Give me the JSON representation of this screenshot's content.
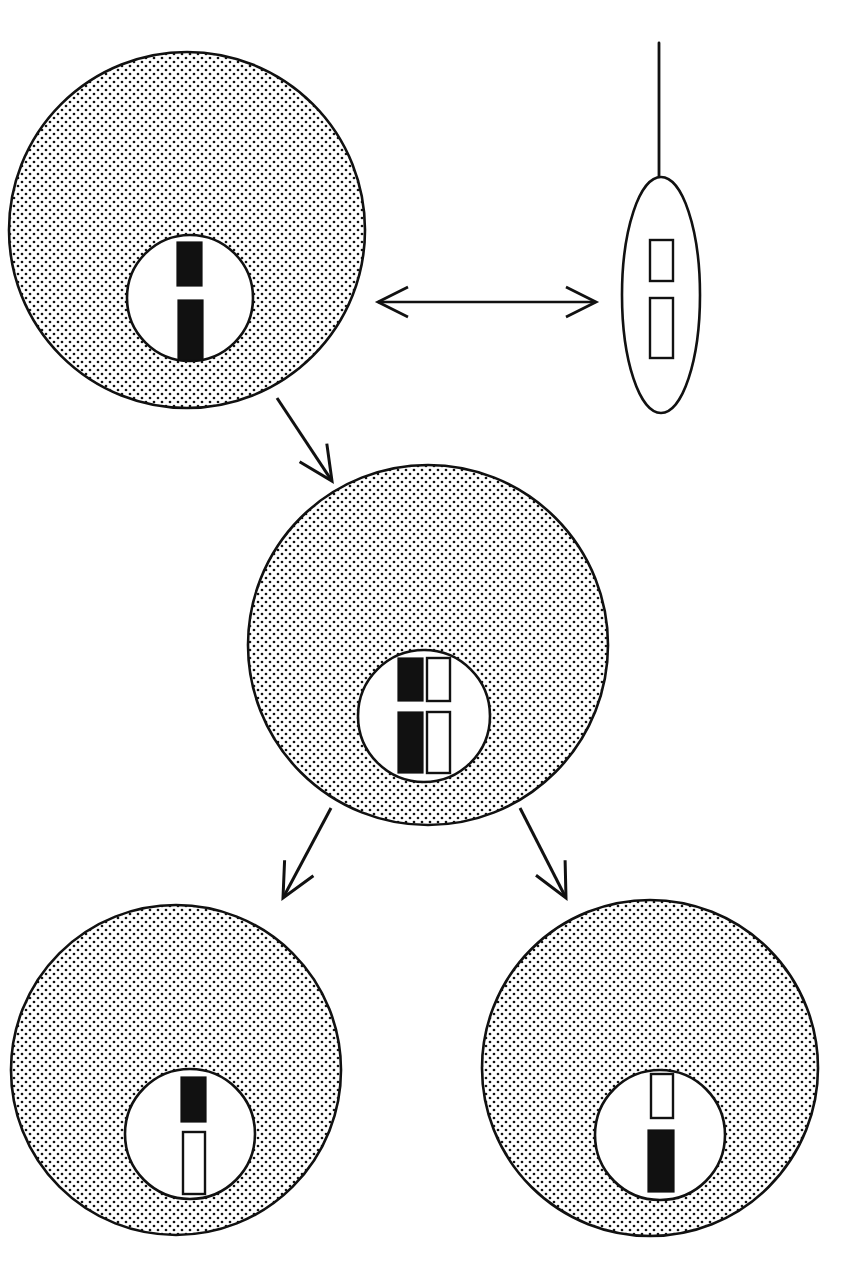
{
  "figure": {
    "kind": "biology-diagram",
    "background_color": "#ffffff",
    "ink_color": "#111111",
    "width": 856,
    "height": 1266
  },
  "legend_colors": {
    "maternal_chromosome_fill": "#111111",
    "paternal_chromosome_fill": "#ffffff",
    "outline": "#111111",
    "cytoplasm_stipple": "#111111",
    "nucleoplasm": "#ffffff"
  },
  "cells": [
    {
      "id": "egg",
      "name": "egg-cell",
      "shape": "circle",
      "cx": 187,
      "cy": 230,
      "r": 178,
      "cytoplasm": "stippled",
      "nucleus": {
        "cx": 190,
        "cy": 298,
        "r": 63,
        "fill": "#ffffff"
      },
      "chromosome_count": 2,
      "chromosomes": [
        {
          "id": "egg-chr-short",
          "origin": "maternal",
          "fill": "#111111",
          "x": 177,
          "y": 242,
          "w": 25,
          "h": 44
        },
        {
          "id": "egg-chr-long",
          "origin": "maternal",
          "fill": "#111111",
          "x": 178,
          "y": 300,
          "w": 25,
          "h": 60
        }
      ]
    },
    {
      "id": "sperm",
      "name": "sperm-cell",
      "shape": "ellipse",
      "cx": 661,
      "cy": 295,
      "rx": 39,
      "ry": 118,
      "cytoplasm": "clear",
      "tail": {
        "x": 659,
        "y_top": 43,
        "y_bottom": 180
      },
      "chromosome_count": 2,
      "chromosomes": [
        {
          "id": "sperm-chr-short",
          "origin": "paternal",
          "fill": "#ffffff",
          "x": 650,
          "y": 240,
          "w": 23,
          "h": 41
        },
        {
          "id": "sperm-chr-long",
          "origin": "paternal",
          "fill": "#ffffff",
          "x": 650,
          "y": 298,
          "w": 23,
          "h": 60
        }
      ]
    },
    {
      "id": "zygote",
      "name": "zygote-cell",
      "shape": "circle",
      "cx": 428,
      "cy": 645,
      "r": 180,
      "cytoplasm": "stippled",
      "nucleus": {
        "cx": 424,
        "cy": 716,
        "r": 66,
        "fill": "#ffffff"
      },
      "chromosome_count": 4,
      "chromosomes": [
        {
          "id": "zygote-chr-maternal-short",
          "origin": "maternal",
          "fill": "#111111",
          "x": 398,
          "y": 658,
          "w": 25,
          "h": 43
        },
        {
          "id": "zygote-chr-paternal-short",
          "origin": "paternal",
          "fill": "#ffffff",
          "x": 427,
          "y": 658,
          "w": 23,
          "h": 43
        },
        {
          "id": "zygote-chr-maternal-long",
          "origin": "maternal",
          "fill": "#111111",
          "x": 398,
          "y": 712,
          "w": 25,
          "h": 61
        },
        {
          "id": "zygote-chr-paternal-long",
          "origin": "paternal",
          "fill": "#ffffff",
          "x": 427,
          "y": 712,
          "w": 23,
          "h": 61
        }
      ]
    },
    {
      "id": "daughter-left",
      "name": "daughter-cell-left",
      "shape": "circle",
      "cx": 176,
      "cy": 1070,
      "r": 165,
      "cytoplasm": "stippled",
      "nucleus": {
        "cx": 190,
        "cy": 1134,
        "r": 65,
        "fill": "#ffffff"
      },
      "chromosome_count": 2,
      "chromosomes": [
        {
          "id": "daughter-left-chr-maternal",
          "origin": "maternal",
          "fill": "#111111",
          "x": 181,
          "y": 1077,
          "w": 25,
          "h": 45
        },
        {
          "id": "daughter-left-chr-paternal",
          "origin": "paternal",
          "fill": "#ffffff",
          "x": 183,
          "y": 1132,
          "w": 22,
          "h": 62
        }
      ]
    },
    {
      "id": "daughter-right",
      "name": "daughter-cell-right",
      "shape": "circle",
      "cx": 650,
      "cy": 1068,
      "r": 168,
      "cytoplasm": "stippled",
      "nucleus": {
        "cx": 660,
        "cy": 1135,
        "r": 65,
        "fill": "#ffffff"
      },
      "chromosome_count": 2,
      "chromosomes": [
        {
          "id": "daughter-right-chr-paternal",
          "origin": "paternal",
          "fill": "#ffffff",
          "x": 651,
          "y": 1074,
          "w": 22,
          "h": 44
        },
        {
          "id": "daughter-right-chr-maternal",
          "origin": "maternal",
          "fill": "#111111",
          "x": 648,
          "y": 1130,
          "w": 26,
          "h": 62
        }
      ]
    }
  ],
  "connectors": [
    {
      "id": "gamete-link",
      "name": "egg-sperm-double-arrow",
      "style": "double-headed",
      "x1": 378,
      "y1": 302,
      "x2": 596,
      "y2": 302
    },
    {
      "id": "fertilization-arrow",
      "name": "fertilization-arrow",
      "style": "single-headed",
      "x1": 277,
      "y1": 398,
      "x2": 332,
      "y2": 481
    },
    {
      "id": "cleavage-arrow-left",
      "name": "cleavage-arrow-left",
      "style": "single-headed",
      "x1": 331,
      "y1": 808,
      "x2": 283,
      "y2": 898
    },
    {
      "id": "cleavage-arrow-right",
      "name": "cleavage-arrow-right",
      "style": "single-headed",
      "x1": 520,
      "y1": 808,
      "x2": 566,
      "y2": 898
    }
  ]
}
